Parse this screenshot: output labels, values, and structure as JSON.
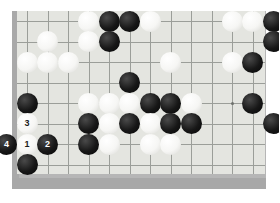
{
  "app": {
    "title": "Go Board Position",
    "board_type": "go-board"
  },
  "board": {
    "surface_color": "#e4e5e0",
    "frame_color": "#b6b6b6",
    "line_color": "#9b9e99",
    "black_stone_color": "#171717",
    "white_stone_color": "#f6f6f4",
    "columns": 13,
    "rows": 9,
    "cell_size": 20.5,
    "origin_x": 27,
    "origin_y": 21,
    "stone_diameter": 21,
    "hoshi_points": [
      [
        11,
        5
      ]
    ],
    "numbered_move_label_1": "1",
    "numbered_move_label_2": "2",
    "numbered_move_label_3": "3",
    "numbered_move_label_4": "4"
  },
  "stones": [
    {
      "col": 4,
      "row": 1,
      "color": "white",
      "label": ""
    },
    {
      "col": 5,
      "row": 1,
      "color": "black",
      "label": ""
    },
    {
      "col": 6,
      "row": 1,
      "color": "black",
      "label": ""
    },
    {
      "col": 7,
      "row": 1,
      "color": "white",
      "label": ""
    },
    {
      "col": 11,
      "row": 1,
      "color": "white",
      "label": ""
    },
    {
      "col": 12,
      "row": 1,
      "color": "white",
      "label": ""
    },
    {
      "col": 13,
      "row": 1,
      "color": "black",
      "label": ""
    },
    {
      "col": 2,
      "row": 2,
      "color": "white",
      "label": ""
    },
    {
      "col": 4,
      "row": 2,
      "color": "white",
      "label": ""
    },
    {
      "col": 5,
      "row": 2,
      "color": "black",
      "label": ""
    },
    {
      "col": 13,
      "row": 2,
      "color": "black",
      "label": ""
    },
    {
      "col": 1,
      "row": 3,
      "color": "white",
      "label": ""
    },
    {
      "col": 2,
      "row": 3,
      "color": "white",
      "label": ""
    },
    {
      "col": 3,
      "row": 3,
      "color": "white",
      "label": ""
    },
    {
      "col": 8,
      "row": 3,
      "color": "white",
      "label": ""
    },
    {
      "col": 11,
      "row": 3,
      "color": "white",
      "label": ""
    },
    {
      "col": 12,
      "row": 3,
      "color": "black",
      "label": ""
    },
    {
      "col": 6,
      "row": 4,
      "color": "black",
      "label": ""
    },
    {
      "col": 1,
      "row": 5,
      "color": "black",
      "label": ""
    },
    {
      "col": 4,
      "row": 5,
      "color": "white",
      "label": ""
    },
    {
      "col": 5,
      "row": 5,
      "color": "white",
      "label": ""
    },
    {
      "col": 6,
      "row": 5,
      "color": "white",
      "label": ""
    },
    {
      "col": 7,
      "row": 5,
      "color": "black",
      "label": ""
    },
    {
      "col": 8,
      "row": 5,
      "color": "black",
      "label": ""
    },
    {
      "col": 9,
      "row": 5,
      "color": "white",
      "label": ""
    },
    {
      "col": 12,
      "row": 5,
      "color": "black",
      "label": ""
    },
    {
      "col": 1,
      "row": 6,
      "color": "white",
      "label": "3"
    },
    {
      "col": 4,
      "row": 6,
      "color": "black",
      "label": ""
    },
    {
      "col": 5,
      "row": 6,
      "color": "white",
      "label": ""
    },
    {
      "col": 6,
      "row": 6,
      "color": "black",
      "label": ""
    },
    {
      "col": 7,
      "row": 6,
      "color": "white",
      "label": ""
    },
    {
      "col": 8,
      "row": 6,
      "color": "black",
      "label": ""
    },
    {
      "col": 9,
      "row": 6,
      "color": "black",
      "label": ""
    },
    {
      "col": 13,
      "row": 6,
      "color": "black",
      "label": ""
    },
    {
      "col": 0,
      "row": 7,
      "color": "black",
      "label": "4"
    },
    {
      "col": 1,
      "row": 7,
      "color": "white",
      "label": "1"
    },
    {
      "col": 2,
      "row": 7,
      "color": "black",
      "label": "2"
    },
    {
      "col": 4,
      "row": 7,
      "color": "black",
      "label": ""
    },
    {
      "col": 5,
      "row": 7,
      "color": "white",
      "label": ""
    },
    {
      "col": 7,
      "row": 7,
      "color": "white",
      "label": ""
    },
    {
      "col": 8,
      "row": 7,
      "color": "white",
      "label": ""
    },
    {
      "col": 1,
      "row": 8,
      "color": "black",
      "label": ""
    }
  ]
}
